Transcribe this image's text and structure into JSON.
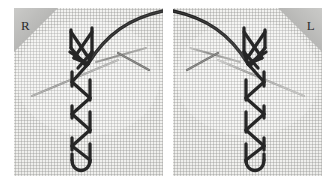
{
  "figure": {
    "caption_absent": true,
    "panel_count": 2,
    "background_color": "#ffffff"
  },
  "panels": [
    {
      "id": "right-handed",
      "flag_label": "R",
      "flag_position": "top-left",
      "flag_color": "#b6b6b4",
      "fabric_color": "#f1f1ef",
      "fabric_weave": "aida-grid",
      "thread_color": "#2a2a2a",
      "needle_color": "#9a9a98",
      "orientation": "normal"
    },
    {
      "id": "left-handed",
      "flag_label": "L",
      "flag_position": "top-right",
      "flag_color": "#b6b6b4",
      "fabric_color": "#f1f1ef",
      "fabric_weave": "aida-grid",
      "thread_color": "#2a2a2a",
      "needle_color": "#9a9a98",
      "orientation": "mirrored"
    }
  ],
  "colors": {
    "page_background": "#ffffff",
    "fabric_light": "#f7f7f5",
    "fabric_shadow": "#e4e4e1",
    "weave_line": "#929290",
    "thread_dark": "#262626",
    "thread_mid": "#3d3d3d",
    "needle_grey": "#9a9a98",
    "flag_grey_light": "#c8c8c6",
    "flag_grey_dark": "#a8a8a6",
    "label_text": "#2b2b2b"
  }
}
